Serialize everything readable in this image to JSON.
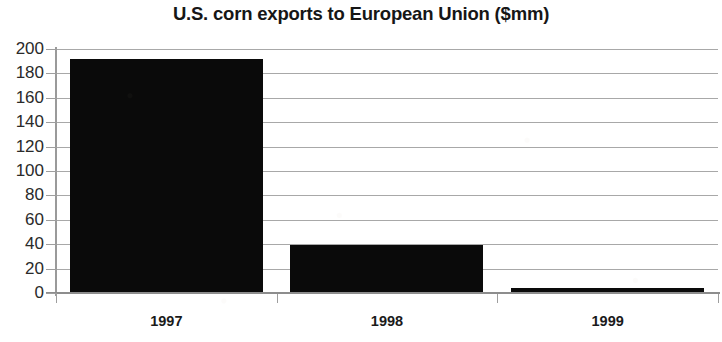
{
  "chart_data": {
    "type": "bar",
    "title": "U.S. corn exports to European Union ($mm)",
    "subtitle": "",
    "xlabel": "",
    "ylabel": "",
    "categories": [
      "1997",
      "1998",
      "1999"
    ],
    "values": [
      192,
      39,
      4
    ],
    "series": [
      {
        "name": "U.S. corn exports to European Union ($mm)",
        "values": [
          192,
          39,
          4
        ]
      }
    ],
    "ylim": [
      0,
      200
    ],
    "ytick_labels": [
      "200",
      "180",
      "160",
      "140",
      "120",
      "100",
      "80",
      "60",
      "40",
      "20",
      "0"
    ],
    "ytick_values": [
      200,
      180,
      160,
      140,
      120,
      100,
      80,
      60,
      40,
      20,
      0
    ],
    "ytick_interval": 20,
    "grid": true,
    "grid_axis": "y",
    "legend": false,
    "legend_position": "none",
    "bar_color": "#0a0a0a",
    "grid_color": "#a8a8a8",
    "axis_color": "#8d8d8d",
    "background_color": "#ffffff",
    "text_color": "#1a1a1a",
    "annotations": []
  }
}
